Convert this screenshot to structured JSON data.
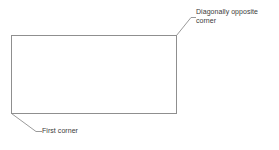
{
  "diagram": {
    "type": "annotated-rectangle",
    "background_color": "#ffffff",
    "stroke_color": "#8f8f8f",
    "text_color": "#3a3a3a",
    "rectangle": {
      "name": "rectangle-shape",
      "x": 11,
      "y": 35,
      "width": 165,
      "height": 78
    },
    "callouts": [
      {
        "id": "diagonally-opposite-corner",
        "lines": [
          "Diagonally opposite",
          "corner"
        ],
        "anchor_corner": "top-right",
        "anchor_x": 176,
        "anchor_y": 35,
        "elbow_x": 191,
        "elbow_y": 17,
        "tip_x": 196,
        "tip_y": 17,
        "text_x": 196,
        "text_y": 8
      },
      {
        "id": "first-corner",
        "lines": [
          "First corner"
        ],
        "anchor_corner": "bottom-left",
        "anchor_x": 11,
        "anchor_y": 113,
        "elbow_x": 36,
        "elbow_y": 131,
        "tip_x": 42,
        "tip_y": 131,
        "text_x": 42,
        "text_y": 127
      }
    ]
  },
  "labels": {
    "diagonal_line1": "Diagonally opposite",
    "diagonal_line2": "corner",
    "first_corner": "First corner"
  }
}
